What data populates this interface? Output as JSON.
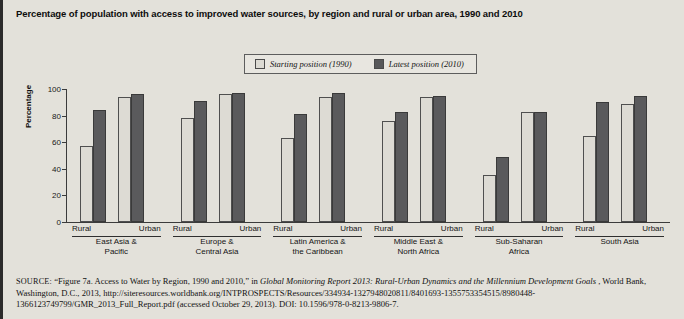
{
  "title": "Percentage of population with access to improved water sources, by region and rural or urban area, 1990 and 2010",
  "legend": {
    "items": [
      {
        "label": "Starting position (1990)",
        "swatch": "light",
        "color": "#dcdad3"
      },
      {
        "label": "Latest position (2010)",
        "swatch": "dark",
        "color": "#58585a"
      }
    ]
  },
  "axis": {
    "ylabel": "Percentage",
    "yticks": [
      "0",
      "20",
      "40",
      "60",
      "80",
      "100"
    ],
    "sub_labels": [
      "Rural",
      "Urban"
    ]
  },
  "chart_data": {
    "type": "bar",
    "title": "Percentage of population with access to improved water sources, by region and rural or urban area, 1990 and 2010",
    "xlabel": "",
    "ylabel": "Percentage",
    "ylim": [
      0,
      100
    ],
    "ytick_step": 20,
    "grid": false,
    "legend_position": "top-center",
    "series": [
      {
        "name": "Starting position (1990)",
        "color": "#dcdad3"
      },
      {
        "name": "Latest position (2010)",
        "color": "#58585a"
      }
    ],
    "groups": [
      {
        "region": "East Asia & Pacific",
        "region_lines": [
          "East Asia &",
          "Pacific"
        ],
        "areas": [
          {
            "area": "Rural",
            "values": {
              "1990": 57,
              "2010": 84
            }
          },
          {
            "area": "Urban",
            "values": {
              "1990": 94,
              "2010": 96
            }
          }
        ]
      },
      {
        "region": "Europe & Central Asia",
        "region_lines": [
          "Europe &",
          "Central Asia"
        ],
        "areas": [
          {
            "area": "Rural",
            "values": {
              "1990": 78,
              "2010": 91
            }
          },
          {
            "area": "Urban",
            "values": {
              "1990": 96,
              "2010": 97
            }
          }
        ]
      },
      {
        "region": "Latin America & the Caribbean",
        "region_lines": [
          "Latin America &",
          "the Caribbean"
        ],
        "areas": [
          {
            "area": "Rural",
            "values": {
              "1990": 63,
              "2010": 81
            }
          },
          {
            "area": "Urban",
            "values": {
              "1990": 94,
              "2010": 97
            }
          }
        ]
      },
      {
        "region": "Middle East & North Africa",
        "region_lines": [
          "Middle East &",
          "North Africa"
        ],
        "areas": [
          {
            "area": "Rural",
            "values": {
              "1990": 76,
              "2010": 83
            }
          },
          {
            "area": "Urban",
            "values": {
              "1990": 94,
              "2010": 95
            }
          }
        ]
      },
      {
        "region": "Sub-Saharan Africa",
        "region_lines": [
          "Sub-Saharan",
          "Africa"
        ],
        "areas": [
          {
            "area": "Rural",
            "values": {
              "1990": 35,
              "2010": 49
            }
          },
          {
            "area": "Urban",
            "values": {
              "1990": 83,
              "2010": 83
            }
          }
        ]
      },
      {
        "region": "South Asia",
        "region_lines": [
          "South Asia",
          ""
        ],
        "areas": [
          {
            "area": "Rural",
            "values": {
              "1990": 65,
              "2010": 90
            }
          },
          {
            "area": "Urban",
            "values": {
              "1990": 89,
              "2010": 95
            }
          }
        ]
      }
    ]
  },
  "source": {
    "label": "SOURCE:",
    "text_1": "“Figure 7a. Access to Water by Region, 1990 and 2010,” in ",
    "italic_1": "Global Monitoring Report 2013: Rural-Urban Dynamics and the Millennium Development Goals",
    "text_2": ", World Bank, Washington, D.C., 2013, http://siteresources.worldbank.org/INTPROSPECTS/Resources/334934-1327948020811/8401693-1355753354515/8980448-1366123749799/GMR_2013_Full_Report.pdf (accessed October 29, 2013). DOI: 10.1596/978-0-8213-9806-7."
  }
}
